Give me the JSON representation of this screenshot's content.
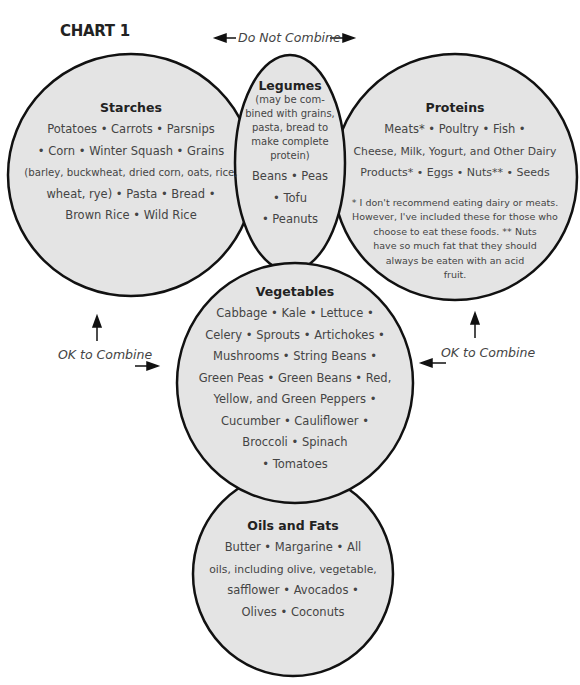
{
  "chart": {
    "title": "CHART 1",
    "fill_color": "#e4e4e4",
    "stroke_color": "#111111"
  },
  "labels": {
    "do_not_combine": "Do Not Combine",
    "ok_left": "OK to Combine",
    "ok_right": "OK to Combine"
  },
  "groups": {
    "starches": {
      "heading": "Starches",
      "items": "Potatoes • Carrots • Parsnips • Corn • Winter Squash • Grains (barley, buckwheat, dried corn, oats, rice, wheat, rye) • Pasta • Bread • Brown Rice • Wild Rice",
      "lines": [
        "Potatoes • Carrots • Parsnips",
        "• Corn • Winter Squash • Grains",
        "(barley, buckwheat, dried corn, oats, rice,",
        "wheat, rye) • Pasta • Bread •",
        "Brown Rice • Wild Rice"
      ]
    },
    "legumes": {
      "heading": "Legumes",
      "note_lines": [
        "(may be com-",
        "bined with grains,",
        "pasta, bread to",
        "make complete",
        "protein)"
      ],
      "lines": [
        "Beans • Peas",
        "• Tofu",
        "• Peanuts"
      ]
    },
    "proteins": {
      "heading": "Proteins",
      "lines": [
        "Meats* • Poultry • Fish •",
        "Cheese, Milk, Yogurt, and Other Dairy",
        "Products* • Eggs • Nuts** • Seeds"
      ],
      "footnote_lines": [
        "* I don't recommend eating dairy or meats.",
        "However, I've included these for those who",
        "choose to eat these foods. ** Nuts",
        "have so much fat that they should",
        "always be eaten with an acid",
        "fruit."
      ]
    },
    "vegetables": {
      "heading": "Vegetables",
      "lines": [
        "Cabbage • Kale • Lettuce •",
        "Celery • Sprouts • Artichokes •",
        "Mushrooms • String Beans •",
        "Green Peas • Green Beans • Red,",
        "Yellow, and Green Peppers •",
        "Cucumber • Cauliflower •",
        "Broccoli • Spinach",
        "• Tomatoes"
      ]
    },
    "oils": {
      "heading": "Oils and Fats",
      "lines": [
        "Butter • Margarine • All",
        "oils, including olive, vegetable,",
        "safflower • Avocados •",
        "Olives • Coconuts"
      ]
    }
  }
}
